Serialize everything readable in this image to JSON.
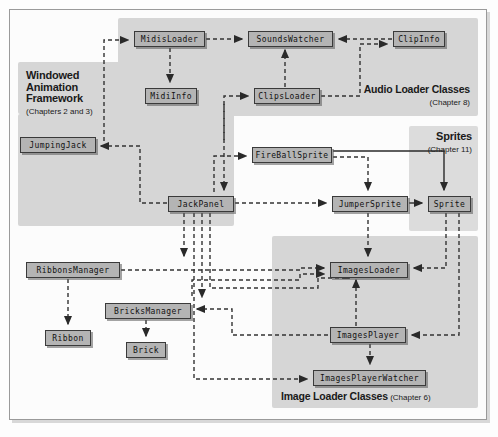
{
  "diagram": {
    "colors": {
      "node_fill": "#b4b4b4",
      "node_stroke": "#3a3a3a",
      "group_fill": "#d6d6d6",
      "group_fill_light": "#dcdcdc",
      "edge": "#333333",
      "page": "#fcfcfc"
    },
    "groups": [
      {
        "id": "windowed-animation-framework",
        "title": "Windowed Animation Framework",
        "subtitle": "(Chapters 2 and 3)",
        "x": 18,
        "y": 62,
        "w": 118,
        "h": 52
      },
      {
        "id": "audio-loader-classes",
        "title": "Audio Loader Classes",
        "subtitle": "(Chapter 8)",
        "x": 118,
        "y": 18,
        "w": 360,
        "h": 98
      },
      {
        "id": "framework-body",
        "title": "",
        "subtitle": "",
        "x": 18,
        "y": 114,
        "w": 216,
        "h": 112
      },
      {
        "id": "sprites",
        "title": "Sprites",
        "subtitle": "(Chapter 11)",
        "x": 409,
        "y": 126,
        "w": 69,
        "h": 105
      },
      {
        "id": "image-loader-classes",
        "title": "Image Loader Classes",
        "subtitle": "(Chapter 6)",
        "x": 272,
        "y": 236,
        "w": 206,
        "h": 172
      }
    ],
    "nodes": [
      {
        "id": "midisloader",
        "label": "MidisLoader",
        "x": 134,
        "y": 31,
        "w": 71
      },
      {
        "id": "soundswatcher",
        "label": "SoundsWatcher",
        "x": 248,
        "y": 31,
        "w": 85
      },
      {
        "id": "clipinfo",
        "label": "ClipInfo",
        "x": 393,
        "y": 31,
        "w": 52
      },
      {
        "id": "midiinfo",
        "label": "MidiInfo",
        "x": 145,
        "y": 88,
        "w": 52
      },
      {
        "id": "clipsloader",
        "label": "ClipsLoader",
        "x": 254,
        "y": 88,
        "w": 66
      },
      {
        "id": "jumpingjack",
        "label": "JumpingJack",
        "x": 20,
        "y": 137,
        "w": 76
      },
      {
        "id": "fireballsprite",
        "label": "FireBallSprite",
        "x": 252,
        "y": 147,
        "w": 80
      },
      {
        "id": "jackpanel",
        "label": "JackPanel",
        "x": 168,
        "y": 196,
        "w": 66
      },
      {
        "id": "jumpersprite",
        "label": "JumperSprite",
        "x": 332,
        "y": 196,
        "w": 76
      },
      {
        "id": "sprite",
        "label": "Sprite",
        "x": 428,
        "y": 196,
        "w": 43
      },
      {
        "id": "ribbonsmanager",
        "label": "RibbonsManager",
        "x": 26,
        "y": 262,
        "w": 94
      },
      {
        "id": "imagesloader",
        "label": "ImagesLoader",
        "x": 330,
        "y": 262,
        "w": 78
      },
      {
        "id": "bricksmanager",
        "label": "BricksManager",
        "x": 105,
        "y": 303,
        "w": 86
      },
      {
        "id": "imagesplayer",
        "label": "ImagesPlayer",
        "x": 330,
        "y": 327,
        "w": 76
      },
      {
        "id": "ribbon",
        "label": "Ribbon",
        "x": 45,
        "y": 330,
        "w": 46
      },
      {
        "id": "brick",
        "label": "Brick",
        "x": 126,
        "y": 342,
        "w": 40
      },
      {
        "id": "imagesplayerwatcher",
        "label": "ImagesPlayerWatcher",
        "x": 313,
        "y": 370,
        "w": 113
      }
    ],
    "edges": [
      {
        "from": "jumpingjack",
        "to": "midisloader",
        "style": "dashed"
      },
      {
        "from": "midisloader",
        "to": "midiinfo",
        "style": "dashed"
      },
      {
        "from": "midisloader",
        "to": "soundswatcher",
        "style": "dashed"
      },
      {
        "from": "clipinfo",
        "to": "soundswatcher",
        "style": "dashed"
      },
      {
        "from": "clipsloader",
        "to": "clipinfo",
        "style": "dashed"
      },
      {
        "from": "clipsloader",
        "to": "soundswatcher",
        "style": "dashed"
      },
      {
        "from": "jumpingjack",
        "to": "clipsloader",
        "style": "dashed"
      },
      {
        "from": "jackpanel",
        "to": "jumpingjack",
        "style": "dashed"
      },
      {
        "from": "jackpanel",
        "to": "fireballsprite",
        "style": "dashed"
      },
      {
        "from": "midiinfo",
        "to": "jackpanel",
        "style": "dashed"
      },
      {
        "from": "jackpanel",
        "to": "jumpersprite",
        "style": "dashed"
      },
      {
        "from": "fireballsprite",
        "to": "jumpersprite",
        "style": "dashed"
      },
      {
        "from": "fireballsprite",
        "to": "sprite",
        "style": "solid"
      },
      {
        "from": "jumpersprite",
        "to": "sprite",
        "style": "solid"
      },
      {
        "from": "jackpanel",
        "to": "ribbonsmanager",
        "style": "dashed"
      },
      {
        "from": "jackpanel",
        "to": "bricksmanager",
        "style": "dashed"
      },
      {
        "from": "ribbonsmanager",
        "to": "ribbon",
        "style": "dashed"
      },
      {
        "from": "bricksmanager",
        "to": "brick",
        "style": "dashed"
      },
      {
        "from": "ribbonsmanager",
        "to": "imagesloader",
        "style": "dashed"
      },
      {
        "from": "bricksmanager",
        "to": "imagesloader",
        "style": "dashed"
      },
      {
        "from": "jackpanel",
        "to": "imagesloader",
        "style": "dashed"
      },
      {
        "from": "sprite",
        "to": "imagesloader",
        "style": "dashed"
      },
      {
        "from": "sprite",
        "to": "imagesplayer",
        "style": "dashed"
      },
      {
        "from": "imagesplayer",
        "to": "imagesloader",
        "style": "dashed"
      },
      {
        "from": "imagesplayer",
        "to": "imagesplayerwatcher",
        "style": "dashed"
      },
      {
        "from": "jackpanel",
        "to": "imagesplayerwatcher",
        "style": "dashed"
      },
      {
        "from": "jumpersprite",
        "to": "imagesloader",
        "style": "dashed"
      },
      {
        "from": "bricksmanager",
        "to": "imagesplayer",
        "style": "dashed"
      }
    ]
  }
}
